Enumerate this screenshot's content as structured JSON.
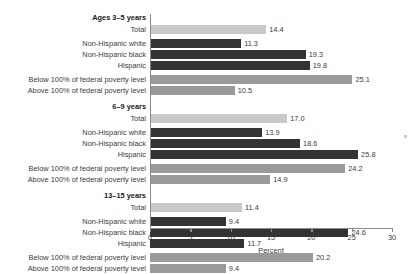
{
  "chart_data": {
    "type": "bar",
    "orientation": "horizontal",
    "title": "",
    "xlabel": "Percent",
    "ylabel": "",
    "xlim": [
      0,
      30
    ],
    "xticks": [
      0,
      5,
      10,
      15,
      20,
      25,
      30
    ],
    "xticklabels": [
      "0",
      "5",
      "10",
      "15",
      "20",
      "25",
      "30"
    ],
    "grid": false,
    "legend": "none",
    "colors": {
      "total": "#c9c9c9",
      "race_ethnicity": "#333333",
      "poverty": "#9a9a9a"
    },
    "groups": [
      {
        "name": "Ages 3–5 years",
        "categories": [
          "Total",
          "Non-Hispanic white",
          "Non-Hispanic black",
          "Hispanic",
          "Below 100% of federal poverty level",
          "Above 100% of federal poverty level"
        ],
        "values": [
          14.4,
          11.3,
          19.3,
          19.8,
          25.1,
          10.5
        ],
        "value_labels": [
          "14.4",
          "11.3",
          "19.3",
          "19.8",
          "25.1",
          "10.5"
        ],
        "series_kinds": [
          "total",
          "race",
          "race",
          "race",
          "pov",
          "pov"
        ]
      },
      {
        "name": "6–9 years",
        "categories": [
          "Total",
          "Non-Hispanic white",
          "Non-Hispanic black",
          "Hispanic",
          "Below 100% of federal poverty level",
          "Above 100% of federal poverty level"
        ],
        "values": [
          17.0,
          13.9,
          18.6,
          25.8,
          24.2,
          14.9
        ],
        "value_labels": [
          "17.0",
          "13.9",
          "18.6",
          "25.8",
          "24.2",
          "14.9"
        ],
        "series_kinds": [
          "total",
          "race",
          "race",
          "race",
          "pov",
          "pov"
        ]
      },
      {
        "name": "13–15 years",
        "categories": [
          "Total",
          "Non-Hispanic white",
          "Non-Hispanic black",
          "Hispanic",
          "Below 100% of federal poverty level",
          "Above 100% of federal poverty level"
        ],
        "values": [
          11.4,
          9.4,
          24.6,
          11.7,
          20.2,
          9.4
        ],
        "value_labels": [
          "11.4",
          "9.4",
          "24.6",
          "11.7",
          "20.2",
          "9.4"
        ],
        "series_kinds": [
          "total",
          "race",
          "race",
          "race",
          "pov",
          "pov"
        ]
      }
    ]
  }
}
